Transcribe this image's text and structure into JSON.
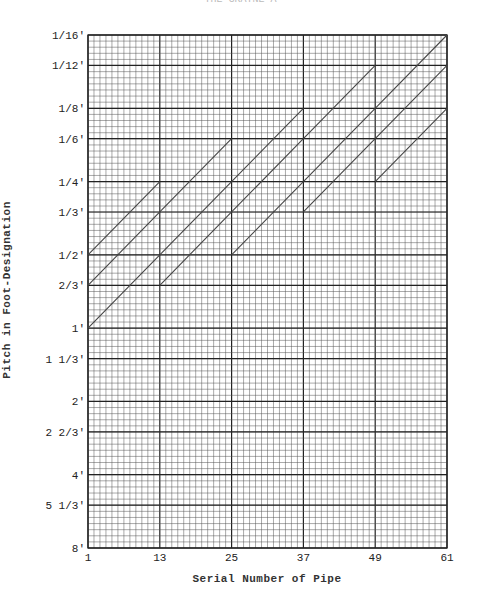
{
  "header_text": "THE GRATNE A",
  "chart_data": {
    "type": "line",
    "title": "",
    "xlabel": "Serial Number of Pipe",
    "ylabel": "Pitch in Foot-Designation",
    "x_ticks": [
      1,
      13,
      25,
      37,
      49,
      61
    ],
    "x_range": [
      1,
      61
    ],
    "y_scale": "log2 (pitch ascending upward)",
    "y_ticks": [
      "1/16'",
      "1/12'",
      "1/8'",
      "1/6'",
      "1/4'",
      "1/3'",
      "1/2'",
      "2/3'",
      "1'",
      "1 1/3'",
      "2'",
      "2 2/3'",
      "4'",
      "5 1/3'",
      "8'"
    ],
    "y_tick_feet": [
      0.0625,
      0.0833,
      0.125,
      0.1667,
      0.25,
      0.3333,
      0.5,
      0.6667,
      1,
      1.3333,
      2,
      2.6667,
      4,
      5.3333,
      8
    ],
    "grid": true,
    "legend": null,
    "series": [
      {
        "name": "group-1-a",
        "x": [
          1,
          13
        ],
        "y_feet": [
          1,
          0.5
        ]
      },
      {
        "name": "group-1-b",
        "x": [
          1,
          13
        ],
        "y_feet": [
          0.6667,
          0.3333
        ]
      },
      {
        "name": "group-1-c",
        "x": [
          1,
          13
        ],
        "y_feet": [
          0.5,
          0.25
        ]
      },
      {
        "name": "group-2-a",
        "x": [
          13,
          25
        ],
        "y_feet": [
          0.6667,
          0.3333
        ]
      },
      {
        "name": "group-2-b",
        "x": [
          13,
          25
        ],
        "y_feet": [
          0.5,
          0.25
        ]
      },
      {
        "name": "group-2-c",
        "x": [
          13,
          25
        ],
        "y_feet": [
          0.3333,
          0.1667
        ]
      },
      {
        "name": "group-3-a",
        "x": [
          25,
          37
        ],
        "y_feet": [
          0.5,
          0.25
        ]
      },
      {
        "name": "group-3-b",
        "x": [
          25,
          37
        ],
        "y_feet": [
          0.3333,
          0.1667
        ]
      },
      {
        "name": "group-3-c",
        "x": [
          25,
          37
        ],
        "y_feet": [
          0.25,
          0.125
        ]
      },
      {
        "name": "group-4-a",
        "x": [
          37,
          49
        ],
        "y_feet": [
          0.3333,
          0.1667
        ]
      },
      {
        "name": "group-4-b",
        "x": [
          37,
          49
        ],
        "y_feet": [
          0.25,
          0.125
        ]
      },
      {
        "name": "group-4-c",
        "x": [
          37,
          49
        ],
        "y_feet": [
          0.1667,
          0.0833
        ]
      },
      {
        "name": "group-5-a",
        "x": [
          49,
          61
        ],
        "y_feet": [
          0.25,
          0.125
        ]
      },
      {
        "name": "group-5-b",
        "x": [
          49,
          61
        ],
        "y_feet": [
          0.1667,
          0.0833
        ]
      },
      {
        "name": "group-5-c",
        "x": [
          49,
          61
        ],
        "y_feet": [
          0.125,
          0.0625
        ]
      }
    ]
  },
  "colors": {
    "grid_minor": "#555555",
    "grid_major": "#222222",
    "line": "#444444"
  }
}
